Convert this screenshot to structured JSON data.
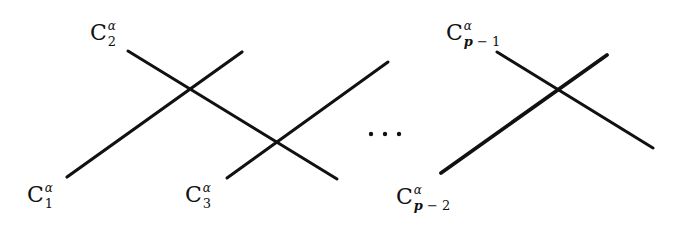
{
  "diagram": {
    "type": "intersecting-lines-chain",
    "line_color": "#111111",
    "labels": {
      "c1": {
        "base": "C",
        "sup": "α",
        "sub": "1"
      },
      "c2": {
        "base": "C",
        "sup": "α",
        "sub": "2"
      },
      "c3": {
        "base": "C",
        "sup": "α",
        "sub": "3"
      },
      "cp2": {
        "base": "C",
        "sup": "α",
        "sub_var": "p",
        "sub_rest": " − 2"
      },
      "cp1": {
        "base": "C",
        "sup": "α",
        "sub_var": "p",
        "sub_rest": " − 1"
      }
    },
    "ellipsis": "⋯",
    "lines": [
      {
        "name": "C1",
        "x1": 67,
        "y1": 177,
        "x2": 242,
        "y2": 52
      },
      {
        "name": "C2",
        "x1": 128,
        "y1": 51,
        "x2": 337,
        "y2": 179
      },
      {
        "name": "C3",
        "x1": 227,
        "y1": 178,
        "x2": 388,
        "y2": 62
      },
      {
        "name": "Cp-2",
        "x1": 441,
        "y1": 173,
        "x2": 607,
        "y2": 55
      },
      {
        "name": "Cp-1",
        "x1": 497,
        "y1": 52,
        "x2": 653,
        "y2": 148
      }
    ]
  }
}
